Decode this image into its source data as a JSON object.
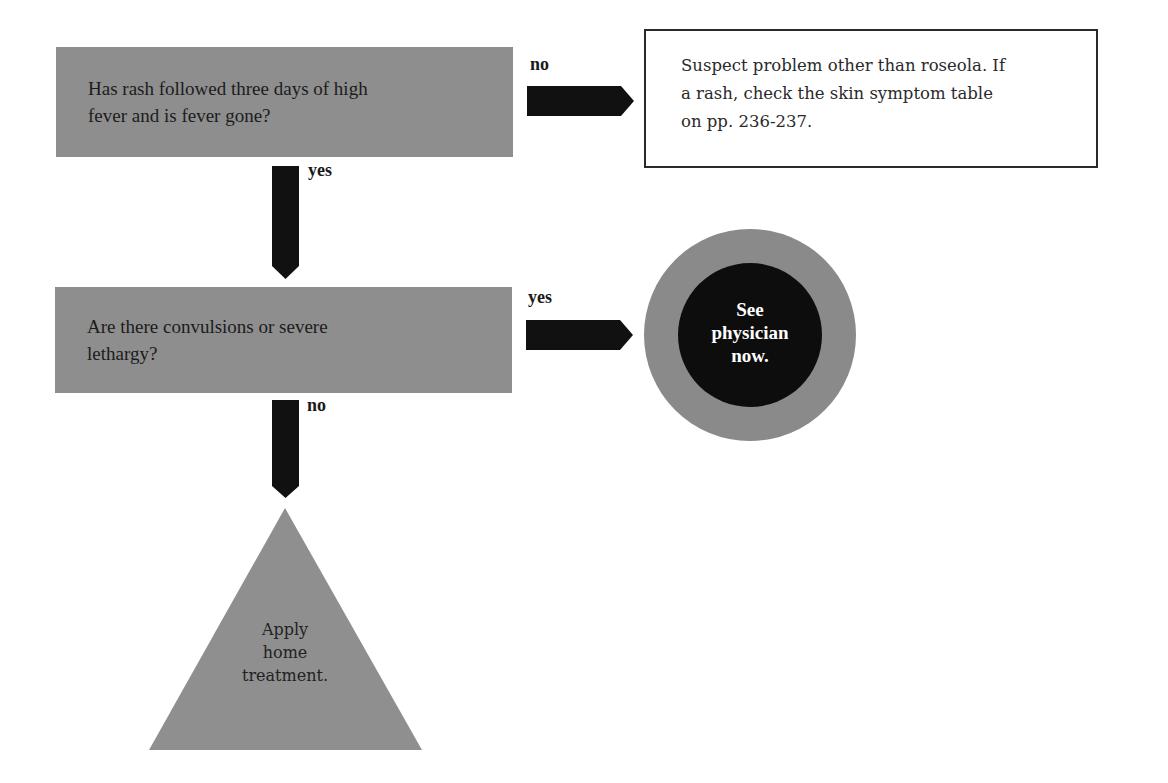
{
  "flowchart": {
    "question1": {
      "text": "Has rash followed three days of high fever and is fever gone?",
      "line1": "Has rash followed three days of high",
      "line2": "fever and is fever gone?"
    },
    "branch1_no": {
      "label": "no",
      "result": {
        "line1": "Suspect problem other than roseola. If",
        "line2": "a rash, check the skin symptom table",
        "line3": "on pp. 236-237."
      }
    },
    "branch1_yes": {
      "label": "yes"
    },
    "question2": {
      "text": "Are there convulsions or severe lethargy?",
      "line1": "Are there convulsions or severe",
      "line2": "lethargy?"
    },
    "branch2_yes": {
      "label": "yes",
      "result": {
        "line1": "See",
        "line2": "physician",
        "line3": "now."
      }
    },
    "branch2_no": {
      "label": "no",
      "result": {
        "line1": "Apply",
        "line2": "home",
        "line3": "treatment."
      }
    }
  },
  "colors": {
    "question_box": "#8e8e8e",
    "arrow": "#111111",
    "circle_outer": "#8a8a8a",
    "circle_inner": "#0d0d0d",
    "triangle": "#8f8f8f",
    "outline_border": "#2a2a2a"
  }
}
